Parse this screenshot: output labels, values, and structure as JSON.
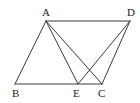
{
  "diagram": {
    "type": "geometry-figure",
    "points": {
      "A": {
        "label": "A",
        "x": 46,
        "y": 21
      },
      "D": {
        "label": "D",
        "x": 130,
        "y": 21
      },
      "B": {
        "label": "B",
        "x": 15,
        "y": 84
      },
      "E": {
        "label": "E",
        "x": 78,
        "y": 84
      },
      "C": {
        "label": "C",
        "x": 102,
        "y": 84
      }
    },
    "segments": [
      [
        "A",
        "D"
      ],
      [
        "A",
        "B"
      ],
      [
        "B",
        "C"
      ],
      [
        "C",
        "D"
      ],
      [
        "A",
        "E"
      ],
      [
        "A",
        "C"
      ],
      [
        "D",
        "E"
      ]
    ],
    "labels": {
      "A": {
        "text": "A",
        "x": 42,
        "y": 16
      },
      "D": {
        "text": "D",
        "x": 127,
        "y": 16
      },
      "B": {
        "text": "B",
        "x": 12,
        "y": 97
      },
      "E": {
        "text": "E",
        "x": 73,
        "y": 97
      },
      "C": {
        "text": "C",
        "x": 98,
        "y": 97
      }
    },
    "colors": {
      "line": "#3a3a3a",
      "text": "#222222",
      "background": "#ffffff"
    }
  }
}
